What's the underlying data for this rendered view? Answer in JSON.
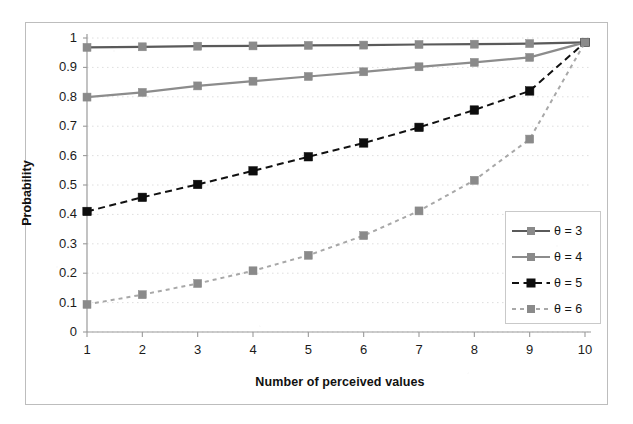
{
  "figure": {
    "y_axis_title": "Probability",
    "x_axis_title": "Number of perceived values"
  },
  "legend": {
    "items": [
      {
        "label": "θ = 3",
        "series": "theta3"
      },
      {
        "label": "θ = 4",
        "series": "theta4"
      },
      {
        "label": "θ = 5",
        "series": "theta5"
      },
      {
        "label": "θ = 6",
        "series": "theta6"
      }
    ]
  },
  "axes": {
    "y_ticks": [
      "1",
      "0.9",
      "0.8",
      "0.7",
      "0.6",
      "0.5",
      "0.4",
      "0.3",
      "0.2",
      "0.1",
      "0"
    ],
    "x_ticks": [
      "1",
      "2",
      "3",
      "4",
      "5",
      "6",
      "7",
      "8",
      "9",
      "10"
    ]
  },
  "colors": {
    "theta3": "#5a5a5a",
    "theta4": "#8c8c8c",
    "theta5": "#111111",
    "theta6": "#a8a8a8",
    "marker_gray": "#8a8a8a",
    "marker_black": "#0d0d0d",
    "axis": "#9a9a9a",
    "gridline": "#d8d8d8",
    "frame": "#bdbdbd"
  },
  "chart_data": {
    "type": "line",
    "title": "",
    "xlabel": "Number of perceived values",
    "ylabel": "Probability",
    "xlim": [
      1,
      10
    ],
    "ylim": [
      0,
      1
    ],
    "x": [
      1,
      2,
      3,
      4,
      5,
      6,
      7,
      8,
      9,
      10
    ],
    "grid": "horizontal-dotted",
    "legend_position": "right-inside",
    "series": [
      {
        "name": "θ = 3",
        "style": "solid",
        "color": "#5a5a5a",
        "marker": "square",
        "marker_color": "#8a8a8a",
        "values": [
          0.968,
          0.97,
          0.972,
          0.973,
          0.975,
          0.976,
          0.978,
          0.979,
          0.981,
          0.985
        ]
      },
      {
        "name": "θ = 4",
        "style": "solid",
        "color": "#8c8c8c",
        "marker": "square",
        "marker_color": "#8a8a8a",
        "values": [
          0.799,
          0.815,
          0.837,
          0.853,
          0.869,
          0.885,
          0.902,
          0.917,
          0.934,
          0.985
        ]
      },
      {
        "name": "θ = 5",
        "style": "dashed",
        "color": "#111111",
        "marker": "square",
        "marker_color": "#0d0d0d",
        "values": [
          0.41,
          0.458,
          0.502,
          0.548,
          0.596,
          0.643,
          0.696,
          0.755,
          0.82,
          0.985
        ]
      },
      {
        "name": "θ = 6",
        "style": "dotted",
        "color": "#a8a8a8",
        "marker": "square",
        "marker_color": "#8a8a8a",
        "values": [
          0.094,
          0.127,
          0.165,
          0.208,
          0.261,
          0.328,
          0.412,
          0.516,
          0.656,
          0.985
        ]
      }
    ]
  }
}
